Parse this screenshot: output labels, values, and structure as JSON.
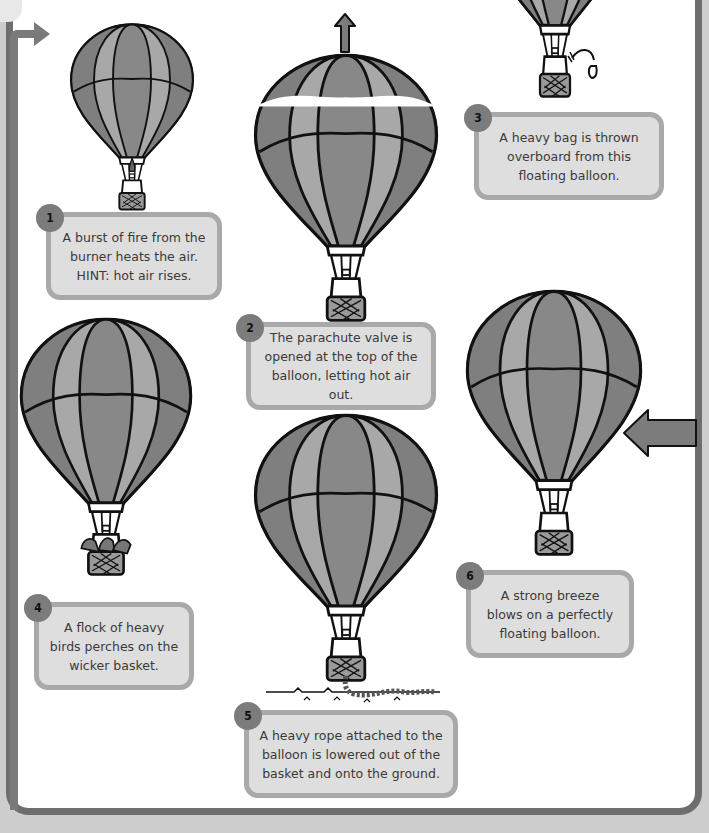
{
  "colors": {
    "panel_border": "#6e6e6e",
    "card_fill": "#dedede",
    "card_border": "#a9a9a9",
    "badge": "#7c7c7c",
    "balloon_dark": "#7f7f7f",
    "balloon_light": "#a8a8a8",
    "outline": "#111111"
  },
  "cards": [
    {
      "number": "1",
      "text": "A burst of fire from the\nburner heats the air.\nHINT: hot air rises."
    },
    {
      "number": "2",
      "text": "The parachute valve is\nopened at the top of the\nballoon, letting hot air out."
    },
    {
      "number": "3",
      "text": "A heavy bag is thrown\noverboard from this\nfloating balloon."
    },
    {
      "number": "4",
      "text": "A flock of heavy\nbirds perches on the\nwicker basket."
    },
    {
      "number": "5",
      "text": "A heavy rope attached to the\nballoon is lowered out of the\nbasket and onto the ground."
    },
    {
      "number": "6",
      "text": "A strong breeze\nblows on a perfectly\nfloating balloon."
    }
  ],
  "icons": {
    "flow_arrow": "arrow-right-icon",
    "up_arrow": "arrow-up-icon",
    "wind_arrow": "arrow-left-icon",
    "sandbag": "sandbag-icon",
    "birds": "birds-icon",
    "rope": "rope-icon",
    "flame": "flame-icon"
  }
}
